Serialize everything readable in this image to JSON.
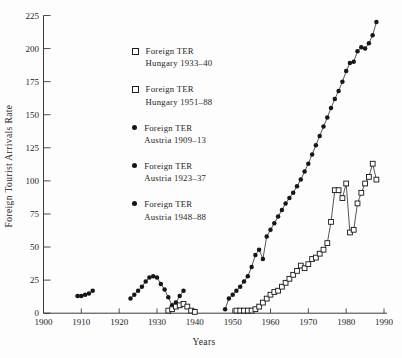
{
  "figure": {
    "x_axis_title": "Years",
    "y_axis_title": "Foreign Tourist Arrivals Rate"
  },
  "legend": {
    "entries": [
      {
        "marker": "open-square",
        "line1": "Foreign TER",
        "line2": "Hungary 1933–40"
      },
      {
        "marker": "open-square",
        "line1": "Foreign TER",
        "line2": "Hungary 1951–88"
      },
      {
        "marker": "filled-circle",
        "line1": "Foreign TER",
        "line2": "Austria 1909–13"
      },
      {
        "marker": "filled-circle",
        "line1": "Foreign TER",
        "line2": "Austria 1923–37"
      },
      {
        "marker": "filled-circle",
        "line1": "Foreign TER",
        "line2": "Austria 1948–88"
      }
    ]
  },
  "colors": {
    "marker": "#161616",
    "line": "#1d1d1d",
    "axis": "#3a3a3a",
    "tick_text": "#242424",
    "background": "#fdfdfd"
  },
  "chart_data": {
    "type": "scatter",
    "title": "",
    "xlabel": "Years",
    "ylabel": "Foreign Tourist Arrivals Rate",
    "xlim": [
      1900,
      1990
    ],
    "ylim": [
      0,
      225
    ],
    "x_ticks": [
      1900,
      1910,
      1920,
      1930,
      1940,
      1950,
      1960,
      1970,
      1980,
      1990
    ],
    "y_ticks": [
      0,
      25,
      50,
      75,
      100,
      125,
      150,
      175,
      200,
      225
    ],
    "grid": false,
    "legend_position": "upper-left-inside",
    "series": [
      {
        "id": "austria-1909-13",
        "name": "Foreign TER Austria 1909–13",
        "marker": "filled-circle",
        "x": [
          1909,
          1910,
          1911,
          1912,
          1913
        ],
        "y": [
          13,
          13,
          14,
          15,
          17
        ]
      },
      {
        "id": "austria-1923-37",
        "name": "Foreign TER Austria 1923–37",
        "marker": "filled-circle",
        "x": [
          1923,
          1924,
          1925,
          1926,
          1927,
          1928,
          1929,
          1930,
          1931,
          1932,
          1933,
          1934,
          1935,
          1936,
          1937
        ],
        "y": [
          11,
          14,
          17,
          20,
          24,
          27,
          28,
          27,
          22,
          18,
          12,
          6,
          8,
          13,
          17
        ]
      },
      {
        "id": "hungary-1933-40",
        "name": "Foreign TER Hungary 1933–40",
        "marker": "open-square",
        "x": [
          1933,
          1934,
          1935,
          1936,
          1937,
          1938,
          1939,
          1940
        ],
        "y": [
          2,
          3,
          5,
          6,
          7,
          5,
          2,
          1
        ]
      },
      {
        "id": "austria-1948-88",
        "name": "Foreign TER Austria 1948–88",
        "marker": "filled-circle",
        "x": [
          1948,
          1949,
          1950,
          1951,
          1952,
          1953,
          1954,
          1955,
          1956,
          1957,
          1958,
          1959,
          1960,
          1961,
          1962,
          1963,
          1964,
          1965,
          1966,
          1967,
          1968,
          1969,
          1970,
          1971,
          1972,
          1973,
          1974,
          1975,
          1976,
          1977,
          1978,
          1979,
          1980,
          1981,
          1982,
          1983,
          1984,
          1985,
          1986,
          1987,
          1988
        ],
        "y": [
          3,
          11,
          14,
          17,
          20,
          24,
          28,
          35,
          44,
          48,
          41,
          58,
          63,
          68,
          73,
          78,
          83,
          87,
          91,
          96,
          101,
          107,
          113,
          120,
          127,
          134,
          141,
          148,
          155,
          162,
          168,
          175,
          183,
          189,
          190,
          198,
          201,
          200,
          204,
          210,
          220
        ]
      },
      {
        "id": "hungary-1951-88",
        "name": "Foreign TER Hungary 1951–88",
        "marker": "open-square",
        "x": [
          1951,
          1952,
          1953,
          1954,
          1955,
          1956,
          1957,
          1958,
          1959,
          1960,
          1961,
          1962,
          1963,
          1964,
          1965,
          1966,
          1967,
          1968,
          1969,
          1970,
          1971,
          1972,
          1973,
          1974,
          1975,
          1976,
          1977,
          1978,
          1979,
          1980,
          1981,
          1982,
          1983,
          1984,
          1985,
          1986,
          1987,
          1988
        ],
        "y": [
          2,
          2,
          2,
          2,
          2,
          3,
          5,
          8,
          11,
          14,
          16,
          17,
          20,
          23,
          26,
          29,
          32,
          36,
          34,
          37,
          41,
          42,
          45,
          48,
          53,
          69,
          93,
          93,
          87,
          98,
          61,
          63,
          83,
          91,
          98,
          103,
          113,
          101
        ]
      }
    ]
  }
}
